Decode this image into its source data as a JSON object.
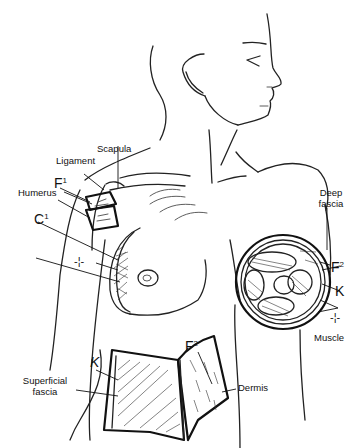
{
  "figure": {
    "labels": {
      "scapula": "Scapula",
      "ligament": "Ligament",
      "humerus": "Humerus",
      "deep_fascia_line1": "Deep",
      "deep_fascia_line2": "fascia",
      "muscle": "Muscle",
      "dermis": "Dermis",
      "superficial_fascia_line1": "Superficial",
      "superficial_fascia_line2": "fascia"
    },
    "symbols": {
      "f1": "F",
      "f1_sup": "1",
      "c1": "C",
      "c1_sup": "1",
      "star_left": "-¦-",
      "f2_right": "F",
      "f2_right_sup": "2",
      "k_right": "K",
      "star_right": "-¦-",
      "f2_bottom": "F",
      "f2_bottom_sup": "2",
      "k_bottom": "K"
    },
    "colors": {
      "ink": "#111111",
      "background": "#ffffff"
    }
  }
}
